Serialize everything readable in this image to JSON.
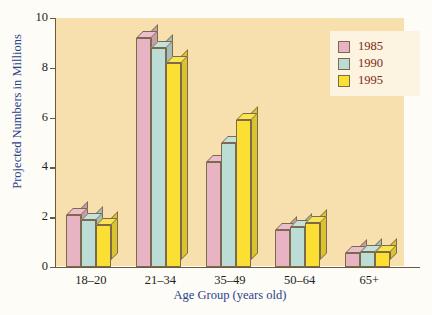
{
  "chart_data": {
    "type": "bar",
    "title": "",
    "xlabel": "Age Group (years old)",
    "ylabel": "Projected Numbers in Millions",
    "categories": [
      "18–20",
      "21–34",
      "35–49",
      "50–64",
      "65+"
    ],
    "series": [
      {
        "name": "1985",
        "color": "#e8b3c3",
        "values": [
          2.1,
          9.2,
          4.2,
          1.5,
          0.55
        ]
      },
      {
        "name": "1990",
        "color": "#bcdcd6",
        "values": [
          1.9,
          8.8,
          5.0,
          1.6,
          0.6
        ]
      },
      {
        "name": "1995",
        "color": "#fbe033",
        "values": [
          1.7,
          8.2,
          5.9,
          1.75,
          0.62
        ]
      }
    ],
    "ylim": [
      0,
      10
    ],
    "yticks": [
      0,
      2,
      4,
      6,
      8,
      10
    ],
    "ytick_labels": [
      "0",
      "2",
      "4",
      "6",
      "8",
      "10"
    ],
    "grid": false,
    "legend_position": "top-right",
    "plot_background": "#f8dfae",
    "figure_background": "#fdfcf7",
    "axis_color": "#6b5a3c",
    "axis_title_color": "#2b3f8c",
    "legend_background": "#fcf3e0",
    "legend_text_color": "#7a2b18",
    "style": "3d-bar"
  }
}
